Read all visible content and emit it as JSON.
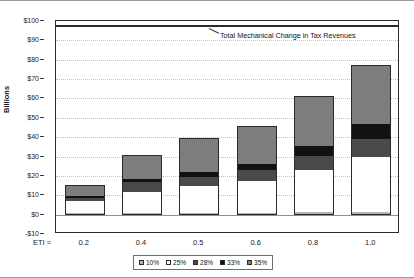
{
  "chart_data": {
    "type": "bar",
    "stacked": true,
    "title": "",
    "xlabel": "ETI =",
    "ylabel": "Billions",
    "categories": [
      "0.2",
      "0.4",
      "0.5",
      "0.6",
      "0.8",
      "1.0"
    ],
    "ylim": [
      -10,
      100
    ],
    "ytick_values": [
      -10,
      0,
      10,
      20,
      30,
      40,
      50,
      60,
      70,
      80,
      90,
      100
    ],
    "ytick_labels": [
      "-$10",
      "$0",
      "$10",
      "$20",
      "$30",
      "$40",
      "$50",
      "$60",
      "$70",
      "$80",
      "$90",
      "$100"
    ],
    "grid": true,
    "legend_position": "bottom",
    "series": [
      {
        "name": "10%",
        "color": "#b3b3b3",
        "values": [
          0.8,
          0.9,
          1.0,
          1.1,
          1.3,
          1.6
        ]
      },
      {
        "name": "25%",
        "color": "#ffffff",
        "values": [
          6.2,
          10.9,
          13.6,
          16.4,
          22.0,
          28.4
        ]
      },
      {
        "name": "28%",
        "color": "#4a4a4a",
        "values": [
          1.4,
          4.9,
          5.0,
          5.3,
          6.9,
          8.9
        ]
      },
      {
        "name": "33%",
        "color": "#121212",
        "values": [
          1.3,
          1.8,
          2.6,
          3.5,
          5.0,
          8.0
        ]
      },
      {
        "name": "35%",
        "color": "#7d7d7d",
        "values": [
          5.8,
          12.5,
          17.3,
          19.7,
          26.3,
          30.6
        ]
      }
    ],
    "totals": [
      15.5,
      31.0,
      39.5,
      46.0,
      61.5,
      77.5
    ],
    "annotations": [
      {
        "text": "Total Mechanical Change in Tax Revenues",
        "value": 98,
        "kind": "reference-line"
      }
    ]
  },
  "legend": {
    "items": [
      {
        "label": "10%",
        "color": "#b3b3b3"
      },
      {
        "label": "25%",
        "color": "#ffffff"
      },
      {
        "label": "28%",
        "color": "#4a4a4a"
      },
      {
        "label": "33%",
        "color": "#121212"
      },
      {
        "label": "35%",
        "color": "#7d7d7d"
      }
    ]
  }
}
